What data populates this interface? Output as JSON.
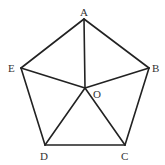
{
  "diagram": {
    "points": [
      {
        "id": "A",
        "label": "A",
        "x": 84,
        "y": 19,
        "lx": 80,
        "ly": 16
      },
      {
        "id": "B",
        "label": "B",
        "x": 149,
        "y": 68,
        "lx": 152,
        "ly": 72
      },
      {
        "id": "C",
        "label": "C",
        "x": 125,
        "y": 145,
        "lx": 121,
        "ly": 160
      },
      {
        "id": "D",
        "label": "D",
        "x": 45,
        "y": 145,
        "lx": 40,
        "ly": 160
      },
      {
        "id": "E",
        "label": "E",
        "x": 21,
        "y": 68,
        "lx": 8,
        "ly": 72
      },
      {
        "id": "O",
        "label": "O",
        "x": 85,
        "y": 88,
        "lx": 93,
        "ly": 98
      }
    ],
    "edges": [
      [
        "A",
        "B"
      ],
      [
        "B",
        "C"
      ],
      [
        "C",
        "D"
      ],
      [
        "D",
        "E"
      ],
      [
        "E",
        "A"
      ],
      [
        "O",
        "A"
      ],
      [
        "O",
        "B"
      ],
      [
        "O",
        "C"
      ],
      [
        "O",
        "D"
      ],
      [
        "O",
        "E"
      ]
    ],
    "line_color": "#222222",
    "background": "#ffffff"
  }
}
